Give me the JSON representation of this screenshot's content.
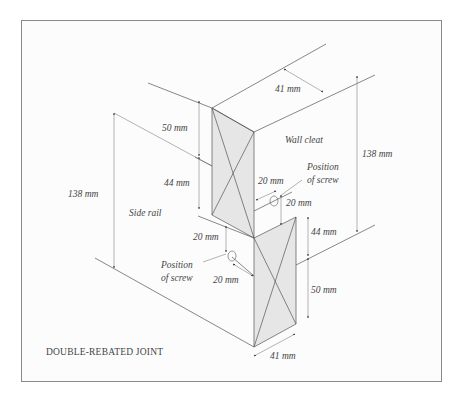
{
  "diagram": {
    "title": "DOUBLE-REBATED JOINT",
    "parts": {
      "wall_cleat": "Wall cleat",
      "side_rail": "Side rail"
    },
    "screw_labels": {
      "upper_line1": "Position",
      "upper_line2": "of screw",
      "lower_line1": "Position",
      "lower_line2": "of screw"
    },
    "dimensions": {
      "top_width": "41 mm",
      "bottom_width": "41 mm",
      "left_upper_50": "50 mm",
      "left_upper_44": "44 mm",
      "right_lower_44": "44 mm",
      "right_lower_50": "50 mm",
      "left_total": "138 mm",
      "right_total": "138 mm",
      "upper_screw_h": "20 mm",
      "upper_screw_v": "20 mm",
      "lower_screw_v": "20 mm",
      "lower_screw_h": "20 mm"
    },
    "colors": {
      "line": "#555555",
      "face_fill": "#e6e6e6",
      "frame_border": "#8a8a8a",
      "text": "#444444"
    }
  }
}
